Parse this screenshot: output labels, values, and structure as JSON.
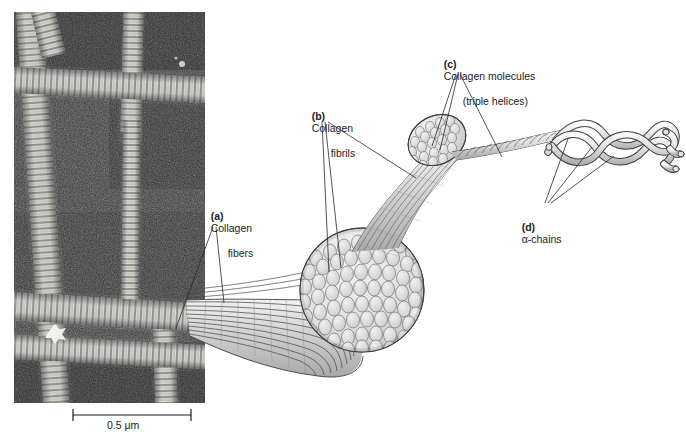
{
  "figure": {
    "type": "scientific-diagram",
    "background_color": "#ffffff"
  },
  "micrograph": {
    "name": "electron-micrograph",
    "description": "Electron micrograph of cross-banded collagen fibers arranged in an orthogonal lattice",
    "x": 14,
    "y": 12,
    "width": 191,
    "height": 391,
    "tone_dark": "#3a3a3a",
    "tone_light": "#e8e8e8"
  },
  "scale_bar": {
    "label": "0.5 μm",
    "x": 72,
    "y": 414,
    "length": 118
  },
  "labels": [
    {
      "id": "a",
      "marker": "(a)",
      "line1": "Collagen",
      "line2": "fibers",
      "x": 199,
      "y": 198,
      "leaders": 2
    },
    {
      "id": "b",
      "marker": "(b)",
      "line1": "Collagen",
      "line2": "fibrils",
      "x": 300,
      "y": 98,
      "leaders": 3
    },
    {
      "id": "c",
      "marker": "(c)",
      "line1": "Collagen molecules",
      "line2": "(triple helices)",
      "x": 432,
      "y": 46,
      "leaders": 3
    },
    {
      "id": "d",
      "marker": "(d)",
      "line1": "α-chains",
      "line2": "",
      "x": 510,
      "y": 209,
      "leaders": 3
    }
  ],
  "illustration": {
    "fiber_bundle": {
      "name": "collagen-fiber-bundle",
      "description": "Splayed bundle of banded collagen fibers emerging from the micrograph"
    },
    "fibril_cross_section_large": {
      "name": "fibril-cross-section-large",
      "description": "Large circular cross-section showing densely packed collagen fibrils",
      "cx": 362,
      "cy": 290,
      "r": 62
    },
    "fibril_cross_section_small": {
      "name": "fibril-cross-section-small",
      "description": "Smaller bundle of fibrils cut obliquely",
      "cx": 435,
      "cy": 140,
      "r": 28
    },
    "triple_helix_rope": {
      "name": "triple-helix-rope",
      "description": "Twisted rope-like collagen molecule (triple helix)"
    },
    "alpha_chains": {
      "name": "alpha-chain-helices",
      "description": "Three alpha-chains coiled into a triple helix, unwinding at the right end",
      "count": 3
    }
  },
  "colors": {
    "ink": "#1c1c1c",
    "line": "#5a5a5a",
    "fill_light": "#dcdcdc",
    "fill_mid": "#c4c4c4",
    "fill_dark": "#9a9a9a"
  }
}
